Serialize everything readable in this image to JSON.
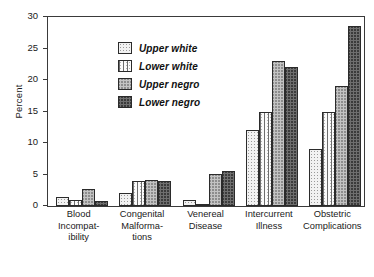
{
  "chart_data": {
    "type": "bar",
    "title": "",
    "xlabel": "",
    "ylabel": "Percent",
    "ylim": [
      0,
      30
    ],
    "yticks": [
      0,
      5,
      10,
      15,
      20,
      25,
      30
    ],
    "ytick_labels": [
      "0",
      "5",
      "10",
      "15",
      "20",
      "25",
      "30"
    ],
    "grid": false,
    "legend_position": "top-left inside plot",
    "categories": [
      "Blood Incompatibility",
      "Congenital Malformations",
      "Venereal Disease",
      "Intercurrent Illness",
      "Obstetric Complications"
    ],
    "category_label_lines": [
      [
        "Blood",
        "Incompat-",
        "ibility"
      ],
      [
        "Congenital",
        "Malforma-",
        "tions"
      ],
      [
        "Venereal",
        "Disease"
      ],
      [
        "Intercurrent",
        "Illness"
      ],
      [
        "Obstetric",
        "Complications"
      ]
    ],
    "series": [
      {
        "name": "Upper white",
        "pattern": "light-dotted",
        "values": [
          1.5,
          2.0,
          1.0,
          12.0,
          9.0
        ]
      },
      {
        "name": "Lower white",
        "pattern": "vertical-lines",
        "values": [
          1.0,
          4.0,
          0.1,
          15.0,
          15.0
        ]
      },
      {
        "name": "Upper negro",
        "pattern": "medium-crosshatch",
        "values": [
          2.7,
          4.2,
          5.1,
          23.0,
          19.0
        ]
      },
      {
        "name": "Lower negro",
        "pattern": "dark-crosshatch",
        "values": [
          0.8,
          3.9,
          5.5,
          22.0,
          28.5
        ]
      }
    ]
  },
  "legend": {
    "items": [
      {
        "label": "Upper white"
      },
      {
        "label": "Lower white"
      },
      {
        "label": "Upper negro"
      },
      {
        "label": "Lower negro"
      }
    ]
  }
}
